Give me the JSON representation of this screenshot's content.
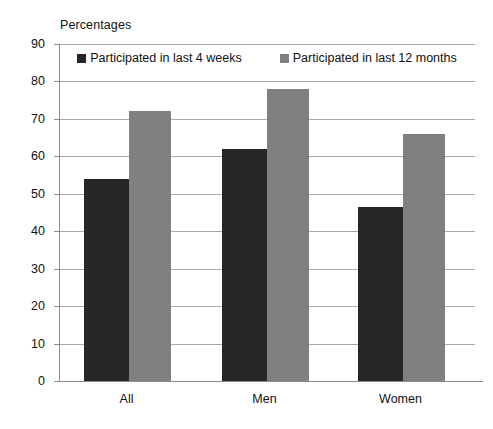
{
  "chart_data": {
    "type": "bar",
    "title": "Percentages",
    "xlabel": "",
    "ylabel": "Percentages",
    "categories": [
      "All",
      "Men",
      "Women"
    ],
    "series": [
      {
        "name": "Participated in last 4 weeks",
        "color": "#262626",
        "values": [
          54,
          62,
          46.5
        ]
      },
      {
        "name": "Participated in last 12 months",
        "color": "#808080",
        "values": [
          72,
          78,
          66
        ]
      }
    ],
    "ylim": [
      0,
      90
    ],
    "ytick_step": 10,
    "yticks": [
      0,
      10,
      20,
      30,
      40,
      50,
      60,
      70,
      80,
      90
    ],
    "ytick_labels": [
      "0",
      "10",
      "20",
      "30",
      "40",
      "50",
      "60",
      "70",
      "80",
      "90"
    ],
    "grid": true,
    "grid_axis": "y",
    "legend_position": "top-inside"
  },
  "axis": {
    "y_title": "Percentages"
  },
  "colors": {
    "series_dark": "#262626",
    "series_gray": "#808080",
    "gridline": "#a8a8a8",
    "axis": "#8c8c8c",
    "text": "#111111",
    "background": "#ffffff"
  }
}
